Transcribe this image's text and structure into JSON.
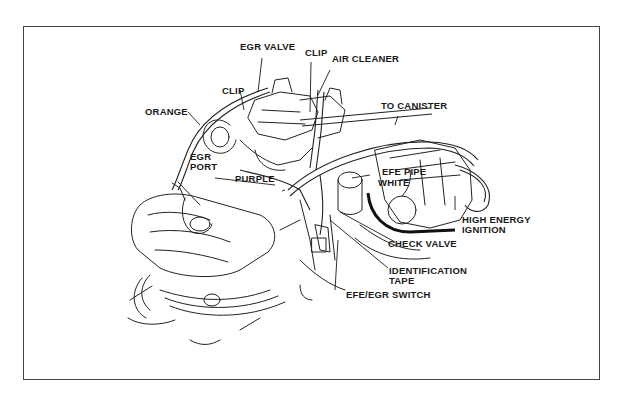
{
  "diagram": {
    "labels": {
      "egr_valve": "EGR VALVE",
      "clip_left": "CLIP",
      "clip_right": "CLIP",
      "air_cleaner": "AIR CLEANER",
      "to_canister": "TO CANISTER",
      "orange": "ORANGE",
      "egr_port_1": "EGR",
      "egr_port_2": "PORT",
      "purple": "PURPLE",
      "efe_pipe": "EFE PIPE",
      "white": "WHITE",
      "high_energy_1": "HIGH ENERGY",
      "high_energy_2": "IGNITION",
      "check_valve": "CHECK VALVE",
      "identification_1": "IDENTIFICATION",
      "identification_2": "TAPE",
      "efe_egr_switch": "EFE/EGR SWITCH"
    }
  }
}
